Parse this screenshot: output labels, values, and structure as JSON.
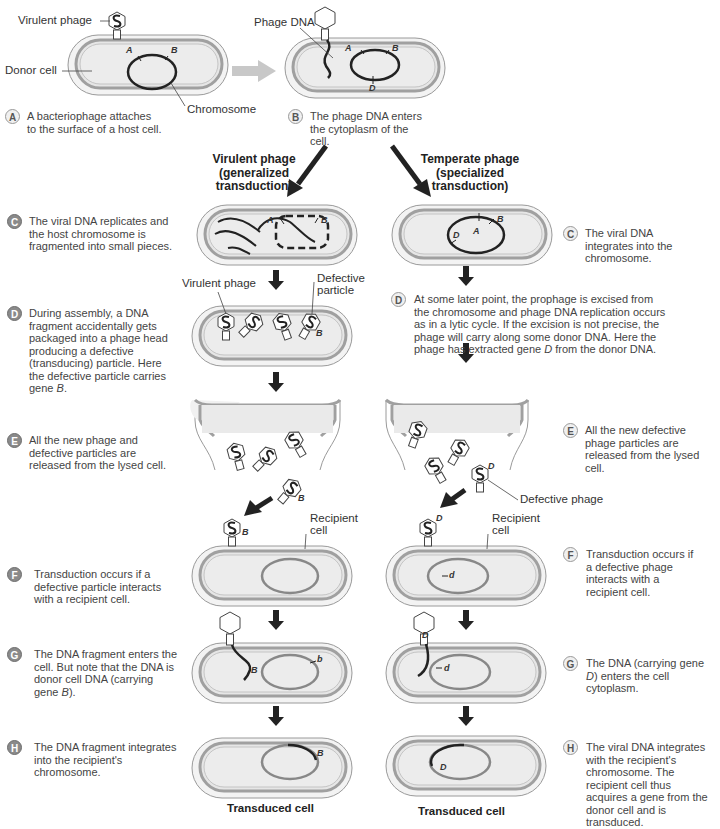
{
  "colors": {
    "cell_fill": "#eaeaea",
    "cell_outer": "#f4f4f4",
    "membrane": "#a6a6a6",
    "dna_dark": "#2a2a2a",
    "recipient_chromosome": "#888888",
    "arrow_dark": "#222222",
    "arrow_light": "#c8c8c8",
    "badge_dark": "#8a8a8a",
    "badge_light": "#f0f0f0"
  },
  "top": {
    "labels": {
      "virulent_phage": "Virulent phage",
      "donor_cell": "Donor cell",
      "chromosome": "Chromosome",
      "phage_dna": "Phage DNA"
    },
    "genes": {
      "a": "A",
      "b": "B",
      "d": "D"
    },
    "steps": [
      {
        "letter": "A",
        "text": "A bacteriophage attaches to the surface of a host cell."
      },
      {
        "letter": "B",
        "text": "The phage DNA enters the cytoplasm of the cell."
      }
    ]
  },
  "branches": {
    "left": {
      "line1": "Virulent phage",
      "line2": "(generalized",
      "line3": "transduction)"
    },
    "right": {
      "line1": "Temperate phage",
      "line2": "(specialized",
      "line3": "transduction)"
    }
  },
  "virulent_steps": [
    {
      "letter": "C",
      "text": "The viral DNA replicates and the host chromosome is fragmented into small pieces."
    },
    {
      "letter": "D",
      "text_before": "During assembly, a DNA fragment accidentally gets packaged into a phage head producing a defective (transducing) particle. Here the defective particle carries gene ",
      "gene": "B",
      "text_after": "."
    },
    {
      "letter": "E",
      "text": "All the new phage and defective particles are released from the lysed cell."
    },
    {
      "letter": "F",
      "text": "Transduction occurs if a defective particle interacts with a recipient cell."
    },
    {
      "letter": "G",
      "text_before": "The DNA fragment enters the cell. But note that the DNA is donor cell DNA (carrying gene ",
      "gene": "B",
      "text_after": ")."
    },
    {
      "letter": "H",
      "text": "The DNA fragment integrates into the recipient's chromosome."
    }
  ],
  "temperate_steps": [
    {
      "letter": "C",
      "text": "The viral DNA integrates into the chromosome."
    },
    {
      "letter": "D",
      "text_before": "At some later point, the prophage is excised from the chromosome and phage DNA replication occurs as in a lytic cycle. If the excision is not precise, the phage will carry along some donor DNA. Here the phage has extracted gene ",
      "gene": "D",
      "text_after": " from the donor DNA."
    },
    {
      "letter": "E",
      "text": "All the new defective phage particles are released from the lysed cell."
    },
    {
      "letter": "F",
      "text": "Transduction occurs if a defective phage interacts with a recipient cell."
    },
    {
      "letter": "G",
      "text_before": "The DNA (carrying gene ",
      "gene": "D",
      "text_after": ") enters the cell cytoplasm."
    },
    {
      "letter": "H",
      "text": "The viral DNA integrates with the recipient's chromosome. The recipient cell thus acquires a gene from the donor cell and is transduced."
    }
  ],
  "diagram_labels": {
    "virulent_phage": "Virulent phage",
    "defective_particle_l1": "Defective",
    "defective_particle_l2": "particle",
    "recipient_l1": "Recipient",
    "recipient_l2": "cell",
    "defective_phage": "Defective phage",
    "gene_B": "B",
    "gene_b": "b",
    "gene_D": "D",
    "gene_d": "d",
    "gene_A": "A"
  },
  "captions": {
    "left": "Transduced cell",
    "right": "Transduced cell"
  }
}
